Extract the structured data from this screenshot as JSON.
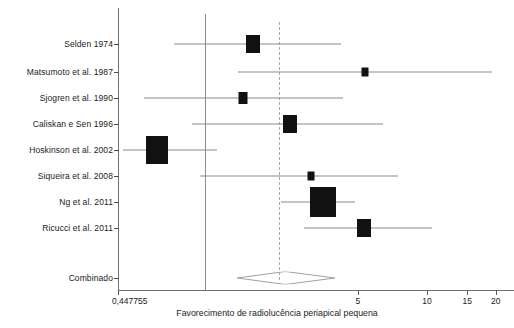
{
  "chart_data": {
    "type": "forest",
    "title": "",
    "xlabel": "Favorecimento de radiolucência periapical pequena",
    "ylabel": "",
    "scale": "log",
    "x_tick_labels": [
      "0,447755",
      "5",
      "10",
      "15",
      "20"
    ],
    "x_tick_values": [
      0.447755,
      5,
      10,
      15,
      20
    ],
    "xlim": [
      0.447755,
      22
    ],
    "null_line_value": 1,
    "pooled_line_value": 2.42,
    "grid": false,
    "legend": null,
    "categories": [
      "Selden 1974",
      "Matsumoto et al. 1987",
      "Sjogren et al. 1990",
      "Caliskan e Sen 1996",
      "Hoskinson et al. 2002",
      "Siqueira et al. 2008",
      "Ng et al. 2011",
      "Ricucci et al. 2011",
      "Combinado"
    ],
    "studies": [
      {
        "label": "Selden 1974",
        "estimate": 1.74,
        "ci_low": 0.79,
        "ci_high": 4.23,
        "weight_box": "medium"
      },
      {
        "label": "Matsumoto et al. 1987",
        "estimate": 5.35,
        "ci_low": 1.49,
        "ci_high": 19.3,
        "weight_box": "small"
      },
      {
        "label": "Sjogren et al. 1990",
        "estimate": 1.57,
        "ci_low": 0.58,
        "ci_high": 4.32,
        "weight_box": "small-medium"
      },
      {
        "label": "Caliskan e Sen 1996",
        "estimate": 2.52,
        "ci_low": 0.94,
        "ci_high": 6.4,
        "weight_box": "medium"
      },
      {
        "label": "Hoskinson et al. 2002",
        "estimate": 0.66,
        "ci_low": 0.47,
        "ci_high": 1.21,
        "weight_box": "large"
      },
      {
        "label": "Siqueira et al. 2008",
        "estimate": 3.13,
        "ci_low": 1.02,
        "ci_high": 7.5,
        "weight_box": "small"
      },
      {
        "label": "Ng et al. 2011",
        "estimate": 3.52,
        "ci_low": 2.3,
        "ci_high": 4.85,
        "weight_box": "x-large"
      },
      {
        "label": "Ricucci et al. 2011",
        "estimate": 5.3,
        "ci_low": 2.9,
        "ci_high": 10.5,
        "weight_box": "medium"
      }
    ],
    "pooled": {
      "label": "Combinado",
      "estimate": 2.42,
      "ci_low": 1.49,
      "ci_high": 3.98
    }
  }
}
